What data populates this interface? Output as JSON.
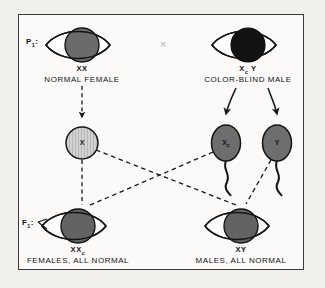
{
  "figure": {
    "border_color": "#3b3b3b",
    "page_background": "#f2f0ec",
    "panel_background": "#fbfaf8",
    "cross_symbol": "×"
  },
  "generations": {
    "parental_tag": "P",
    "parental_tag_sub": "1",
    "f1_tag": "F",
    "f1_tag_sub": "1"
  },
  "parents": [
    {
      "id": "normal-female",
      "genotype": "XX",
      "genotype_sub": "",
      "description": "NORMAL FEMALE",
      "iris_color": "#6b6b6b",
      "sex": "female"
    },
    {
      "id": "color-blind-male",
      "genotype": "X",
      "genotype_sub": "c",
      "genotype_tail": "Y",
      "description": "COLOR-BLIND MALE",
      "iris_color": "#121212",
      "sex": "male"
    }
  ],
  "gametes": [
    {
      "id": "egg-x",
      "type": "egg",
      "label": "X",
      "label_sub": "",
      "fill": "#c9c9c9",
      "hatched": true
    },
    {
      "id": "sperm-xc",
      "type": "sperm",
      "label": "X",
      "label_sub": "c",
      "fill": "#6e6e6e",
      "hatched": false
    },
    {
      "id": "sperm-y",
      "type": "sperm",
      "label": "Y",
      "label_sub": "",
      "fill": "#6e6e6e",
      "hatched": false
    }
  ],
  "offspring": [
    {
      "id": "f1-females",
      "genotype": "XX",
      "genotype_sub": "c",
      "description": "FEMALES, ALL NORMAL",
      "iris_color": "#636363",
      "sex": "female"
    },
    {
      "id": "f1-males",
      "genotype": "XY",
      "genotype_sub": "",
      "description": "MALES, ALL NORMAL",
      "iris_color": "#636363",
      "sex": "male"
    }
  ]
}
